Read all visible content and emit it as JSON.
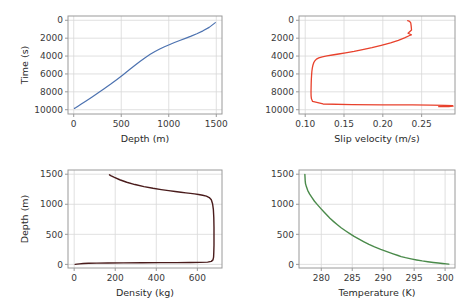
{
  "figure": {
    "width": 465,
    "height": 308,
    "background": "#ffffff",
    "grid_color": "#d8d8d8",
    "spine_color": "#9a9a9a"
  },
  "chart_data": [
    {
      "id": "panel-time-vs-depth",
      "type": "line",
      "title": "",
      "xlabel": "Depth (m)",
      "ylabel": "Time (s)",
      "xlim": [
        -60,
        1560
      ],
      "ylim": [
        -480,
        10480
      ],
      "xticks": [
        0,
        500,
        1000,
        1500
      ],
      "xticklabels": [
        "0",
        "500",
        "1000",
        "1500"
      ],
      "yticks": [
        0,
        2000,
        4000,
        6000,
        8000,
        10000
      ],
      "yticklabels": [
        "0",
        "2000",
        "4000",
        "6000",
        "8000",
        "10000"
      ],
      "grid": true,
      "legend": "none",
      "series": [
        {
          "name": "time",
          "color": "#4c72b0",
          "linewidth": 1.2,
          "x": [
            8,
            20,
            45,
            80,
            130,
            190,
            255,
            320,
            390,
            455,
            520,
            585,
            645,
            700,
            755,
            805,
            855,
            905,
            955,
            1005,
            1060,
            1115,
            1175,
            1235,
            1295,
            1360,
            1425,
            1490
          ],
          "y": [
            9850,
            9780,
            9600,
            9360,
            9020,
            8600,
            8140,
            7660,
            7130,
            6610,
            6080,
            5540,
            5030,
            4570,
            4150,
            3800,
            3490,
            3210,
            2960,
            2730,
            2490,
            2260,
            2020,
            1770,
            1500,
            1180,
            790,
            260
          ]
        }
      ]
    },
    {
      "id": "panel-slip-velocity-vs-time",
      "type": "line",
      "title": "",
      "xlabel": "Slip velocity (m/s)",
      "ylabel": "",
      "xlim": [
        0.092,
        0.293
      ],
      "ylim": [
        -480,
        10480
      ],
      "xticks": [
        0.1,
        0.15,
        0.2,
        0.25
      ],
      "xticklabels": [
        "0.10",
        "0.15",
        "0.20",
        "0.25"
      ],
      "yticks": [
        0,
        2000,
        4000,
        6000,
        8000,
        10000
      ],
      "yticklabels": [
        "0",
        "2000",
        "4000",
        "6000",
        "8000",
        "10000"
      ],
      "grid": true,
      "legend": "none",
      "series": [
        {
          "name": "slip velocity",
          "color": "#e8412c",
          "linewidth": 1.3,
          "x": [
            0.232,
            0.2345,
            0.236,
            0.2365,
            0.237,
            0.2325,
            0.2368,
            0.2345,
            0.228,
            0.22,
            0.21,
            0.198,
            0.186,
            0.174,
            0.163,
            0.152,
            0.143,
            0.135,
            0.128,
            0.122,
            0.1175,
            0.1145,
            0.1125,
            0.111,
            0.11,
            0.1092,
            0.1086,
            0.1082,
            0.1079,
            0.1077,
            0.1076,
            0.1075,
            0.1075,
            0.1076,
            0.108,
            0.1095,
            0.123,
            0.16,
            0.2,
            0.238,
            0.262,
            0.28,
            0.29,
            0.2905,
            0.285,
            0.276,
            0.272
          ],
          "y": [
            40,
            120,
            300,
            620,
            1080,
            1450,
            1620,
            1700,
            1960,
            2240,
            2520,
            2800,
            3060,
            3290,
            3480,
            3640,
            3770,
            3880,
            3980,
            4080,
            4200,
            4340,
            4520,
            4740,
            5000,
            5320,
            5700,
            6140,
            6600,
            7060,
            7480,
            7850,
            8180,
            8480,
            8760,
            9080,
            9360,
            9430,
            9455,
            9470,
            9490,
            9520,
            9560,
            9610,
            9640,
            9655,
            9660
          ]
        }
      ]
    },
    {
      "id": "panel-density-vs-depth",
      "type": "line",
      "title": "",
      "xlabel": "Density (kg)",
      "ylabel": "Depth (m)",
      "xlim": [
        -30,
        720
      ],
      "ylim": [
        1570,
        -60
      ],
      "xticks": [
        0,
        200,
        400,
        600
      ],
      "xticklabels": [
        "0",
        "200",
        "400",
        "600"
      ],
      "yticks": [
        0,
        500,
        1000,
        1500
      ],
      "yticklabels": [
        "0",
        "500",
        "1000",
        "1500"
      ],
      "grid": true,
      "legend": "none",
      "series": [
        {
          "name": "density",
          "color": "#4a1c1c",
          "linewidth": 1.4,
          "x": [
            5,
            14,
            26,
            44,
            70,
            110,
            165,
            240,
            330,
            420,
            500,
            565,
            615,
            650,
            668,
            676,
            679,
            680,
            681,
            681,
            681,
            680,
            678,
            674,
            668,
            658,
            644,
            626,
            606,
            586,
            566,
            544,
            520,
            492,
            460,
            424,
            384,
            340,
            296,
            256,
            222,
            196,
            178,
            172
          ],
          "y": [
            0,
            4,
            9,
            14,
            18,
            21,
            24,
            26,
            28,
            29,
            30,
            31,
            33,
            38,
            50,
            75,
            120,
            200,
            320,
            460,
            620,
            780,
            910,
            1010,
            1075,
            1112,
            1135,
            1150,
            1162,
            1172,
            1181,
            1190,
            1200,
            1212,
            1226,
            1244,
            1266,
            1294,
            1328,
            1366,
            1408,
            1448,
            1478,
            1490
          ]
        }
      ]
    },
    {
      "id": "panel-temperature-vs-depth",
      "type": "line",
      "title": "",
      "xlabel": "Temperature (K)",
      "ylabel": "",
      "xlim": [
        276.4,
        301.6
      ],
      "ylim": [
        1570,
        -60
      ],
      "xticks": [
        280,
        285,
        290,
        295,
        300
      ],
      "xticklabels": [
        "280",
        "285",
        "290",
        "295",
        "300"
      ],
      "yticks": [
        0,
        500,
        1000,
        1500
      ],
      "yticklabels": [
        "0",
        "500",
        "1000",
        "1500"
      ],
      "grid": true,
      "legend": "none",
      "series": [
        {
          "name": "temperature",
          "color": "#4a8a4a",
          "linewidth": 1.4,
          "x": [
            300.6,
            300.2,
            299.6,
            298.9,
            298.1,
            297.2,
            296.3,
            295.4,
            294.5,
            293.6,
            292.9,
            292.4,
            291.6,
            290.6,
            289.6,
            288.6,
            287.7,
            286.9,
            286.1,
            285.3,
            284.6,
            283.9,
            283.2,
            282.6,
            282.0,
            281.4,
            280.9,
            280.4,
            279.9,
            279.4,
            278.9,
            278.5,
            278.1,
            277.8,
            277.6,
            277.45,
            277.4,
            277.38,
            277.36,
            277.35
          ],
          "y": [
            4,
            8,
            14,
            22,
            32,
            44,
            58,
            74,
            92,
            112,
            130,
            148,
            176,
            212,
            250,
            292,
            334,
            376,
            420,
            466,
            512,
            560,
            610,
            660,
            712,
            766,
            820,
            876,
            932,
            990,
            1050,
            1110,
            1172,
            1232,
            1290,
            1344,
            1392,
            1434,
            1470,
            1498
          ]
        }
      ]
    }
  ]
}
